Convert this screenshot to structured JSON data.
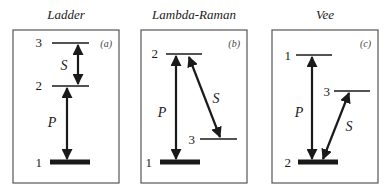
{
  "panels": [
    {
      "title": "Ladder",
      "tag": "(a)",
      "levels": [
        {
          "label": "3",
          "y": 43
        },
        {
          "label": "2",
          "y": 86
        },
        {
          "label": "1",
          "y": 162,
          "ground": true
        }
      ],
      "transitions": [
        {
          "label": "P",
          "from": "1",
          "to": "2"
        },
        {
          "label": "S",
          "from": "2",
          "to": "3"
        }
      ]
    },
    {
      "title": "Lambda-Raman",
      "tag": "(b)",
      "levels": [
        {
          "label": "2",
          "y": 54
        },
        {
          "label": "3",
          "y": 139
        },
        {
          "label": "1",
          "y": 162,
          "ground": true
        }
      ],
      "transitions": [
        {
          "label": "P",
          "from": "1",
          "to": "2"
        },
        {
          "label": "S",
          "from": "3",
          "to": "2"
        }
      ]
    },
    {
      "title": "Vee",
      "tag": "(c)",
      "levels": [
        {
          "label": "1",
          "y": 55
        },
        {
          "label": "3",
          "y": 91
        },
        {
          "label": "2",
          "y": 162,
          "ground": true
        }
      ],
      "transitions": [
        {
          "label": "P",
          "from": "2",
          "to": "1"
        },
        {
          "label": "S",
          "from": "2",
          "to": "3"
        }
      ]
    }
  ]
}
